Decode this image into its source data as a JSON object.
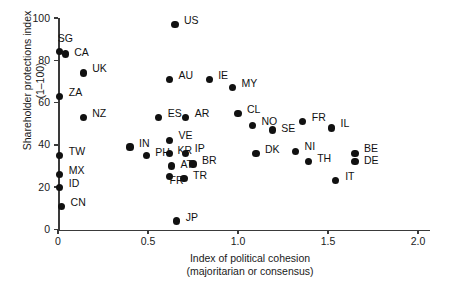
{
  "chart_data": {
    "type": "scatter",
    "title": "",
    "xlabel": "Index of political cohesion (majoritarian or consensus)",
    "ylabel": "Shareholder protections index (1–100)",
    "xlim": [
      0,
      2.15
    ],
    "ylim": [
      0,
      100
    ],
    "xticks": [
      0,
      0.5,
      1.0,
      1.5,
      2.0
    ],
    "xticklabels": [
      "0",
      "0.5",
      "1.0",
      "1.5",
      "2.0"
    ],
    "yticks": [
      0,
      20,
      40,
      60,
      80,
      100
    ],
    "yticklabels": [
      "0",
      "20",
      "40",
      "60",
      "80",
      "100"
    ],
    "grid": false,
    "legend": null,
    "points": [
      {
        "label": "US",
        "x": 0.65,
        "y": 97,
        "lx": 9,
        "ly": -4
      },
      {
        "label": "SG",
        "x": 0.01,
        "y": 84,
        "lx": -2,
        "ly": -13
      },
      {
        "label": "CA",
        "x": 0.04,
        "y": 83,
        "lx": 9,
        "ly": -1
      },
      {
        "label": "UK",
        "x": 0.14,
        "y": 74,
        "lx": 9,
        "ly": -4
      },
      {
        "label": "AU",
        "x": 0.62,
        "y": 71,
        "lx": 9,
        "ly": -4
      },
      {
        "label": "IE",
        "x": 0.84,
        "y": 71,
        "lx": 9,
        "ly": -4
      },
      {
        "label": "MY",
        "x": 0.97,
        "y": 67,
        "lx": 9,
        "ly": -4
      },
      {
        "label": "ZA",
        "x": 0.01,
        "y": 63,
        "lx": 9,
        "ly": -4
      },
      {
        "label": "CL",
        "x": 1.0,
        "y": 55,
        "lx": 9,
        "ly": -4
      },
      {
        "label": "NO",
        "x": 1.08,
        "y": 49,
        "lx": 9,
        "ly": -4
      },
      {
        "label": "SE",
        "x": 1.19,
        "y": 47,
        "lx": 9,
        "ly": -2
      },
      {
        "label": "FR",
        "x": 1.36,
        "y": 51,
        "lx": 9,
        "ly": -4
      },
      {
        "label": "IL",
        "x": 1.52,
        "y": 48,
        "lx": 9,
        "ly": -4
      },
      {
        "label": "NZ",
        "x": 0.14,
        "y": 53,
        "lx": 9,
        "ly": -4
      },
      {
        "label": "ES",
        "x": 0.56,
        "y": 53,
        "lx": 9,
        "ly": -4
      },
      {
        "label": "AR",
        "x": 0.71,
        "y": 53,
        "lx": 9,
        "ly": -4
      },
      {
        "label": "VE",
        "x": 0.62,
        "y": 42,
        "lx": 9,
        "ly": -5
      },
      {
        "label": "IN",
        "x": 0.4,
        "y": 39,
        "lx": 9,
        "ly": -4
      },
      {
        "label": "PH",
        "x": 0.49,
        "y": 35,
        "lx": 9,
        "ly": -3
      },
      {
        "label": "KR",
        "x": 0.62,
        "y": 36,
        "lx": 8,
        "ly": -3
      },
      {
        "label": "IP",
        "x": 0.71,
        "y": 36,
        "lx": 9,
        "ly": -5
      },
      {
        "label": "AT",
        "x": 0.63,
        "y": 30,
        "lx": 9,
        "ly": -2
      },
      {
        "label": "BR",
        "x": 0.75,
        "y": 31,
        "lx": 9,
        "ly": -3
      },
      {
        "label": "FR",
        "x": 0.62,
        "y": 25,
        "lx": 0,
        "ly": 4
      },
      {
        "label": "TR",
        "x": 0.7,
        "y": 24,
        "lx": 9,
        "ly": -3
      },
      {
        "label": "DK",
        "x": 1.1,
        "y": 36,
        "lx": 9,
        "ly": -4
      },
      {
        "label": "NI",
        "x": 1.32,
        "y": 37,
        "lx": 9,
        "ly": -5
      },
      {
        "label": "TH",
        "x": 1.39,
        "y": 32,
        "lx": 9,
        "ly": -3
      },
      {
        "label": "BE",
        "x": 1.65,
        "y": 36,
        "lx": 9,
        "ly": -5
      },
      {
        "label": "DE",
        "x": 1.65,
        "y": 32,
        "lx": 9,
        "ly": -1
      },
      {
        "label": "IT",
        "x": 1.54,
        "y": 23,
        "lx": 10,
        "ly": -4
      },
      {
        "label": "TW",
        "x": 0.01,
        "y": 35,
        "lx": 9,
        "ly": -4
      },
      {
        "label": "MX",
        "x": 0.01,
        "y": 26,
        "lx": 9,
        "ly": -4
      },
      {
        "label": "ID",
        "x": 0.01,
        "y": 20,
        "lx": 9,
        "ly": -4
      },
      {
        "label": "CN",
        "x": 0.02,
        "y": 11,
        "lx": 9,
        "ly": -4
      },
      {
        "label": "JP",
        "x": 0.66,
        "y": 4,
        "lx": 9,
        "ly": -4
      }
    ]
  },
  "axes": {
    "y_title_line1": "Shareholder protections index",
    "y_title_line2": "(1–100)",
    "x_title_line1": "Index of political cohesion",
    "x_title_line2": "(majoritarian or consensus)"
  },
  "colors": {
    "point": "#111111",
    "axis": "#3a3a3a",
    "text": "#1a1a1a",
    "background": "#ffffff"
  }
}
